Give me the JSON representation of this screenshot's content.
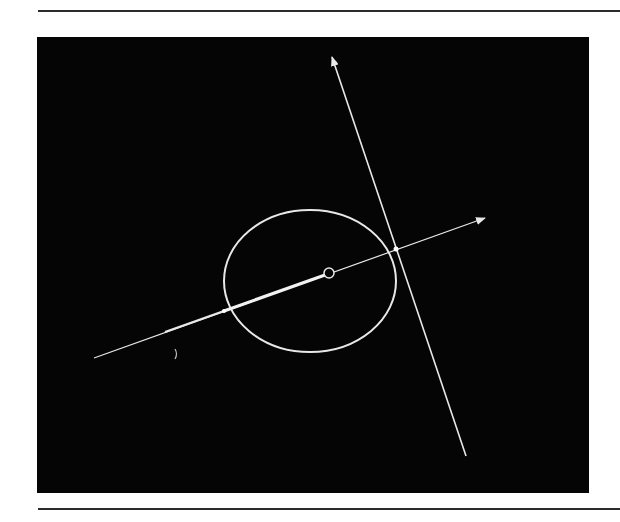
{
  "figure": {
    "colors": {
      "background": "#ffffff",
      "panel": "#050505",
      "stroke": "#e8e8e8",
      "rule": "#2b2b2b"
    },
    "elements": {
      "ellipse": {
        "cx": 310,
        "cy": 281,
        "rx": 86,
        "ry": 71
      },
      "center_point": {
        "cx": 329,
        "cy": 273,
        "r": 5
      },
      "ray": {
        "start": [
          94,
          358
        ],
        "end": [
          485,
          218
        ],
        "arrowhead": "end",
        "thick_segment": {
          "from": [
            224,
            311
          ],
          "to": [
            329,
            273
          ]
        },
        "medium_segment": {
          "from": [
            165,
            332
          ],
          "to": [
            224,
            311
          ]
        }
      },
      "cross_line": {
        "start": [
          466,
          456
        ],
        "end": [
          332,
          57
        ],
        "arrowhead": "end"
      },
      "intersection_right": [
        396,
        249
      ],
      "intersection_left": [
        224,
        311
      ]
    }
  }
}
